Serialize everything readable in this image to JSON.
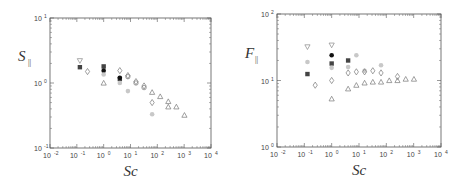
{
  "chart_data": [
    {
      "type": "scatter",
      "title": "",
      "xlabel": "Sc",
      "ylabel": "S_||",
      "xscale": "log",
      "yscale": "log",
      "xlim": [
        0.01,
        10000
      ],
      "ylim": [
        0.1,
        10
      ],
      "x_tick_labels": [
        "10^-2",
        "10^-1",
        "10^0",
        "10^1",
        "10^2",
        "10^3",
        "10^4"
      ],
      "y_tick_labels": [
        "10^-1",
        "10^0",
        "10^1"
      ],
      "grid": false,
      "legend": null,
      "series": [
        {
          "name": "down-triangle (open)",
          "marker": "down-triangle",
          "color": "#888888",
          "points": [
            [
              0.13,
              2.2
            ]
          ]
        },
        {
          "name": "filled square (dark)",
          "marker": "square",
          "color": "#444444",
          "points": [
            [
              0.13,
              1.75
            ],
            [
              1.0,
              1.8
            ],
            [
              4.0,
              1.15
            ]
          ]
        },
        {
          "name": "filled circle (black)",
          "marker": "circle",
          "color": "#111111",
          "points": [
            [
              1.0,
              1.55
            ],
            [
              4.0,
              1.2
            ]
          ]
        },
        {
          "name": "light gray filled",
          "marker": "circle",
          "color": "#c8c8c8",
          "points": [
            [
              1.0,
              1.35
            ],
            [
              4.0,
              1.0
            ],
            [
              8.0,
              0.75
            ],
            [
              64,
              0.33
            ]
          ]
        },
        {
          "name": "open diamond",
          "marker": "diamond",
          "color": "#777777",
          "points": [
            [
              0.25,
              1.5
            ],
            [
              4.0,
              1.55
            ],
            [
              8.0,
              1.3
            ],
            [
              16,
              1.05
            ],
            [
              32,
              0.9
            ],
            [
              64,
              0.5
            ]
          ]
        },
        {
          "name": "open circle",
          "marker": "circle-open",
          "color": "#777777",
          "points": [
            [
              8.0,
              1.25
            ],
            [
              16,
              1.0
            ],
            [
              32,
              0.85
            ]
          ]
        },
        {
          "name": "open triangle",
          "marker": "triangle",
          "color": "#777777",
          "points": [
            [
              1.0,
              1.0
            ],
            [
              64,
              0.72
            ],
            [
              128,
              0.62
            ],
            [
              256,
              0.52
            ],
            [
              256,
              0.43
            ],
            [
              512,
              0.43
            ],
            [
              1024,
              0.32
            ]
          ]
        }
      ]
    },
    {
      "type": "scatter",
      "title": "",
      "xlabel": "Sc",
      "ylabel": "F_||",
      "xscale": "log",
      "yscale": "log",
      "xlim": [
        0.01,
        10000
      ],
      "ylim": [
        1,
        100
      ],
      "x_tick_labels": [
        "10^-2",
        "10^-1",
        "10^0",
        "10^1",
        "10^2",
        "10^3",
        "10^4"
      ],
      "y_tick_labels": [
        "10^0",
        "10^1",
        "10^2"
      ],
      "grid": false,
      "legend": null,
      "series": [
        {
          "name": "down-triangle (open)",
          "marker": "down-triangle",
          "color": "#888888",
          "points": [
            [
              0.13,
              32
            ],
            [
              1.0,
              34
            ]
          ]
        },
        {
          "name": "filled square (dark)",
          "marker": "square",
          "color": "#444444",
          "points": [
            [
              0.13,
              12.5
            ],
            [
              1.0,
              18
            ],
            [
              4.0,
              20
            ]
          ]
        },
        {
          "name": "filled circle (black)",
          "marker": "circle",
          "color": "#111111",
          "points": [
            [
              1.0,
              24
            ]
          ]
        },
        {
          "name": "light gray filled",
          "marker": "circle",
          "color": "#c8c8c8",
          "points": [
            [
              0.13,
              19
            ],
            [
              1.0,
              15.5
            ],
            [
              4.0,
              16
            ],
            [
              8.0,
              24
            ],
            [
              16,
              14
            ],
            [
              64,
              17
            ]
          ]
        },
        {
          "name": "open diamond",
          "marker": "diamond",
          "color": "#777777",
          "points": [
            [
              0.25,
              8.5
            ],
            [
              1.0,
              10
            ],
            [
              4.0,
              13
            ],
            [
              8.0,
              13.5
            ],
            [
              16,
              13.5
            ],
            [
              32,
              14
            ],
            [
              64,
              13
            ],
            [
              256,
              11.5
            ]
          ]
        },
        {
          "name": "open triangle",
          "marker": "triangle",
          "color": "#777777",
          "points": [
            [
              1.0,
              5.3
            ],
            [
              4.0,
              7.5
            ],
            [
              8.0,
              8.5
            ],
            [
              16,
              9.2
            ],
            [
              32,
              9.5
            ],
            [
              64,
              9.5
            ],
            [
              128,
              10
            ],
            [
              256,
              10
            ],
            [
              512,
              10.5
            ],
            [
              1024,
              10.5
            ]
          ]
        }
      ]
    }
  ],
  "panels": {
    "left": {
      "ylabel": "S",
      "ylabel_sub": "||",
      "xlabel": "Sc",
      "yticks": [
        "10",
        "10",
        "10"
      ],
      "yexp": [
        "-1",
        "0",
        "1"
      ]
    },
    "right": {
      "ylabel": "F",
      "ylabel_sub": "||",
      "xlabel": "Sc",
      "yticks": [
        "10",
        "10",
        "10"
      ],
      "yexp": [
        "0",
        "1",
        "2"
      ]
    },
    "xticks": [
      "10",
      "10",
      "10",
      "10",
      "10",
      "10",
      "10"
    ],
    "xexp": [
      "-2",
      "-1",
      "0",
      "1",
      "2",
      "3",
      "4"
    ]
  }
}
